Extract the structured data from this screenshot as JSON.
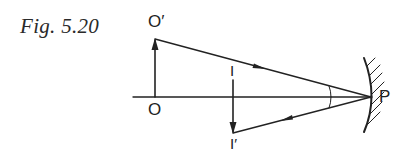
{
  "figure": {
    "caption": "Fig. 5.20",
    "labels": {
      "object_top": "O′",
      "object_base": "O",
      "image_base": "I",
      "image_tip": "I′",
      "pole": "P"
    },
    "elements": {
      "principal_axis": "horizontal line",
      "object_arrow": "upward arrow O→O′",
      "image_arrow": "downward arrow I→I′",
      "incident_ray": "O′ to P",
      "reflected_ray": "P to I′",
      "mirror": "concave mirror with hatched back",
      "angle_marks": "equal angles at P"
    },
    "colors": {
      "ink": "#222222",
      "background": "#ffffff"
    }
  }
}
